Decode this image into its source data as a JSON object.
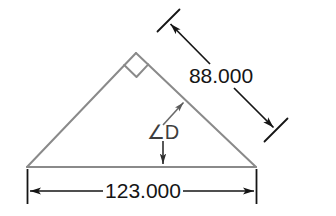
{
  "drawing": {
    "type": "engineering-dimension-drawing",
    "background_color": "#ffffff",
    "shape": {
      "name": "right-triangle",
      "outline_color": "#8a8a8a",
      "vertices": {
        "left": [
          27,
          167
        ],
        "apex": [
          136,
          53
        ],
        "right": [
          256,
          167
        ]
      },
      "right_angle_marker": {
        "at_vertex": "apex",
        "symbol": "square-corner"
      }
    },
    "annotation_color": "#151515",
    "dimensions": [
      {
        "id": "base-dimension",
        "label": "123.000",
        "orientation": "horizontal",
        "measures": "base",
        "arrow_style": "inward-filled",
        "line_y": 191,
        "extension_x": [
          27,
          256
        ]
      },
      {
        "id": "hypotenuse-dimension",
        "label": "88.000",
        "orientation": "diagonal",
        "measures": "hypotenuse",
        "arrow_style": "outward-filled",
        "start": [
          168,
          22
        ],
        "end": [
          276,
          130
        ]
      }
    ],
    "angle_callout": {
      "id": "angle-d",
      "label": "∠D",
      "symbol": "angle-sign",
      "name": "D",
      "leader_targets": [
        "hypotenuse",
        "base"
      ]
    }
  }
}
